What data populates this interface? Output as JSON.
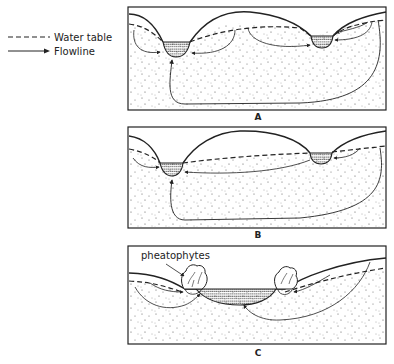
{
  "legend": {
    "items": [
      {
        "label": "Water table",
        "style": "dashed"
      },
      {
        "label": "Flowline",
        "style": "arrow"
      }
    ]
  },
  "panels": [
    {
      "id": "A",
      "label": "A"
    },
    {
      "id": "B",
      "label": "B"
    },
    {
      "id": "C",
      "label": "C",
      "annotation": "pheatophytes"
    }
  ],
  "colors": {
    "line": "#222222",
    "background": "#ffffff",
    "stipple": "#555555"
  }
}
